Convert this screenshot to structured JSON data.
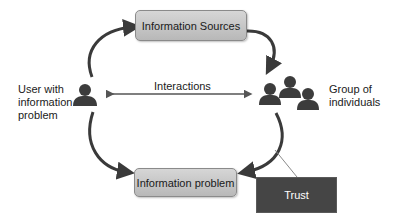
{
  "diagram": {
    "nodes": {
      "information_sources": {
        "label": "Information Sources"
      },
      "information_problem": {
        "label": "Information problem"
      },
      "trust": {
        "label": "Trust"
      }
    },
    "actors": {
      "user": {
        "label_lines": [
          "User with",
          "information",
          "problem"
        ],
        "icon": "person-icon"
      },
      "group": {
        "label_lines": [
          "Group of",
          "individuals"
        ],
        "icon": "group-of-people-icon"
      }
    },
    "edges": {
      "interactions": {
        "label": "Interactions",
        "type": "bidirectional"
      },
      "user_to_sources": {
        "type": "curved-arrow"
      },
      "sources_to_group": {
        "type": "curved-arrow"
      },
      "user_to_problem": {
        "type": "curved-arrow"
      },
      "group_to_problem": {
        "type": "curved-arrow"
      },
      "trust_connector": {
        "type": "line"
      }
    },
    "colors": {
      "box_fill_top": "#d6d6d6",
      "box_fill_bottom": "#b8b8b8",
      "trust_fill": "#454545",
      "arrow": "#3a3a3a",
      "icon": "#3c3c3c"
    }
  }
}
